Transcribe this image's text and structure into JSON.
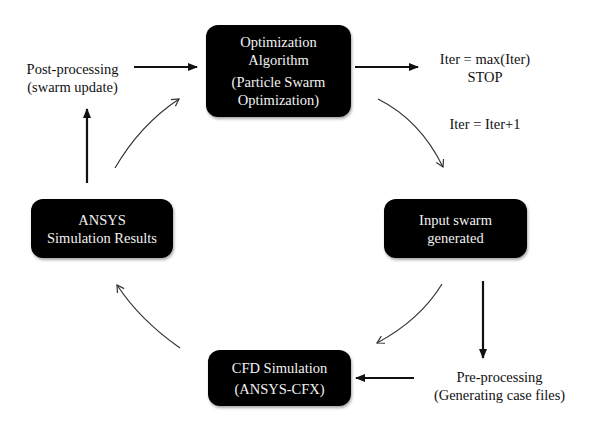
{
  "diagram": {
    "nodes": {
      "optimization": {
        "line1": "Optimization",
        "line2": "Algorithm",
        "line3": "(Particle Swarm",
        "line4": "Optimization)"
      },
      "input_swarm": {
        "line1": "Input swarm",
        "line2": "generated"
      },
      "cfd": {
        "line1": "CFD Simulation",
        "line2": "(ANSYS-CFX)"
      },
      "ansys_results": {
        "line1": "ANSYS",
        "line2": "Simulation Results"
      }
    },
    "labels": {
      "stop": {
        "line1": "Iter = max(Iter)",
        "line2": "STOP"
      },
      "iter_increment": "Iter = Iter+1",
      "pre_processing": {
        "line1": "Pre-processing",
        "line2": "(Generating case files)"
      },
      "post_processing": {
        "line1": "Post-processing",
        "line2": "(swarm update)"
      }
    },
    "edges": [
      {
        "from": "optimization",
        "to": "stop",
        "style": "straight-bold"
      },
      {
        "from": "optimization",
        "to": "input_swarm",
        "style": "curved-thin",
        "label": "iter_increment"
      },
      {
        "from": "input_swarm",
        "to": "pre_processing",
        "style": "straight-bold"
      },
      {
        "from": "pre_processing",
        "to": "cfd",
        "style": "straight-bold"
      },
      {
        "from": "input_swarm",
        "to": "cfd",
        "style": "curved-thin"
      },
      {
        "from": "cfd",
        "to": "ansys_results",
        "style": "curved-thin"
      },
      {
        "from": "ansys_results",
        "to": "post_processing",
        "style": "straight-bold"
      },
      {
        "from": "post_processing",
        "to": "optimization",
        "style": "straight-bold"
      },
      {
        "from": "ansys_results",
        "to": "optimization",
        "style": "curved-thin"
      }
    ],
    "colors": {
      "box_fill": "#000000",
      "box_text": "#f2f2f2",
      "text": "#111111",
      "arrow": "#111111",
      "background": "#ffffff"
    }
  }
}
